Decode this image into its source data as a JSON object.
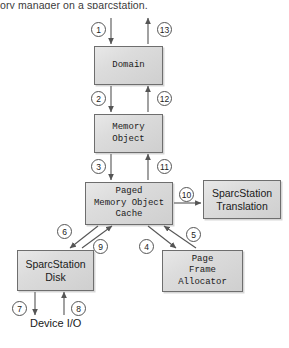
{
  "caption": {
    "text": "ory manager on a sparcstation."
  },
  "diagram": {
    "type": "block-flow-diagram",
    "colors": {
      "node_fill_light": "#e8e8e8",
      "node_fill_dark": "#cfcfcf",
      "node_border": "#6e6e6e",
      "arrow": "#555555",
      "marker_border": "#555555",
      "marker_fill": "#ffffff",
      "text": "#1a1a1a"
    },
    "nodes": [
      {
        "id": "domain",
        "label": "Domain",
        "font": "mono",
        "x": 94,
        "y": 46,
        "w": 69,
        "h": 39
      },
      {
        "id": "memobj",
        "label": "Memory\nObject",
        "font": "mono",
        "x": 94,
        "y": 114,
        "w": 69,
        "h": 39
      },
      {
        "id": "pmoc",
        "label": "Paged\nMemory Object\nCache",
        "font": "mono",
        "x": 85,
        "y": 182,
        "w": 88,
        "h": 43
      },
      {
        "id": "translation",
        "label": "SparcStation\nTranslation",
        "font": "sans",
        "x": 203,
        "y": 180,
        "w": 78,
        "h": 39
      },
      {
        "id": "disk",
        "label": "SparcStation\nDisk",
        "font": "sans",
        "x": 17,
        "y": 250,
        "w": 77,
        "h": 41
      },
      {
        "id": "pfa",
        "label": "Page\nFrame\nAllocator",
        "font": "mono",
        "x": 162,
        "y": 250,
        "w": 81,
        "h": 42
      }
    ],
    "free_labels": [
      {
        "id": "device-io",
        "text": "Device I/O",
        "x": 30,
        "y": 328
      }
    ],
    "markers": [
      {
        "num": "1",
        "x": 91,
        "y": 22
      },
      {
        "num": "13",
        "x": 157,
        "y": 22
      },
      {
        "num": "2",
        "x": 91,
        "y": 91
      },
      {
        "num": "12",
        "x": 157,
        "y": 91
      },
      {
        "num": "3",
        "x": 91,
        "y": 159
      },
      {
        "num": "11",
        "x": 157,
        "y": 159
      },
      {
        "num": "10",
        "x": 179,
        "y": 187
      },
      {
        "num": "6",
        "x": 57,
        "y": 224
      },
      {
        "num": "9",
        "x": 93,
        "y": 239
      },
      {
        "num": "4",
        "x": 139,
        "y": 239
      },
      {
        "num": "5",
        "x": 186,
        "y": 227
      },
      {
        "num": "7",
        "x": 12,
        "y": 301
      },
      {
        "num": "8",
        "x": 71,
        "y": 301
      }
    ],
    "edges": [
      {
        "id": "e1",
        "marker": "1",
        "from": "external-top",
        "to": "domain",
        "direction": "down",
        "x1": 111,
        "y1": 18,
        "x2": 111,
        "y2": 44
      },
      {
        "id": "e13",
        "marker": "13",
        "from": "domain",
        "to": "external-top",
        "direction": "up",
        "x1": 148,
        "y1": 44,
        "x2": 148,
        "y2": 18
      },
      {
        "id": "e2",
        "marker": "2",
        "from": "domain",
        "to": "memobj",
        "direction": "down",
        "x1": 111,
        "y1": 86,
        "x2": 111,
        "y2": 112
      },
      {
        "id": "e12",
        "marker": "12",
        "from": "memobj",
        "to": "domain",
        "direction": "up",
        "x1": 148,
        "y1": 112,
        "x2": 148,
        "y2": 86
      },
      {
        "id": "e3",
        "marker": "3",
        "from": "memobj",
        "to": "pmoc",
        "direction": "down",
        "x1": 111,
        "y1": 154,
        "x2": 111,
        "y2": 180
      },
      {
        "id": "e11",
        "marker": "11",
        "from": "pmoc",
        "to": "memobj",
        "direction": "up",
        "x1": 148,
        "y1": 180,
        "x2": 148,
        "y2": 154
      },
      {
        "id": "e10",
        "marker": "10",
        "from": "pmoc",
        "to": "translation",
        "direction": "right",
        "x1": 174,
        "y1": 203,
        "x2": 201,
        "y2": 203
      },
      {
        "id": "e6",
        "marker": "6",
        "from": "pmoc",
        "to": "disk",
        "direction": "down-left",
        "x1": 98,
        "y1": 226,
        "x2": 70,
        "y2": 248
      },
      {
        "id": "e9",
        "marker": "9",
        "from": "disk",
        "to": "pmoc",
        "direction": "up-right",
        "x1": 82,
        "y1": 248,
        "x2": 112,
        "y2": 226
      },
      {
        "id": "e4",
        "marker": "4",
        "from": "pmoc",
        "to": "pfa",
        "direction": "down-right",
        "x1": 148,
        "y1": 226,
        "x2": 176,
        "y2": 248
      },
      {
        "id": "e5",
        "marker": "5",
        "from": "pfa",
        "to": "pmoc",
        "direction": "up-left",
        "x1": 196,
        "y1": 248,
        "x2": 164,
        "y2": 226
      },
      {
        "id": "e7",
        "marker": "7",
        "from": "disk",
        "to": "device-io",
        "direction": "down",
        "x1": 35,
        "y1": 292,
        "x2": 35,
        "y2": 315
      },
      {
        "id": "e8",
        "marker": "8",
        "from": "device-io",
        "to": "disk",
        "direction": "up",
        "x1": 64,
        "y1": 315,
        "x2": 64,
        "y2": 292
      }
    ]
  }
}
